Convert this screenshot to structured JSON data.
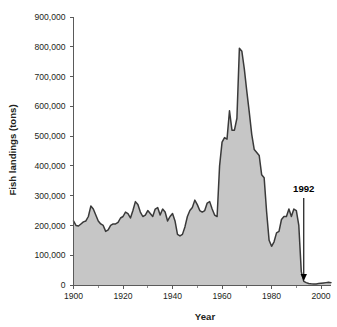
{
  "chart_data": {
    "type": "area",
    "title": "",
    "xlabel": "Year",
    "ylabel": "Fish landings (tons)",
    "xlim": [
      1900,
      2004
    ],
    "ylim": [
      0,
      900000
    ],
    "grid": false,
    "legend": "none",
    "x_ticks": [
      1900,
      1920,
      1940,
      1960,
      1980,
      2000
    ],
    "x_tick_labels": [
      "1900",
      "1920",
      "1940",
      "1960",
      "1980",
      "2000"
    ],
    "x_minor_ticks": [
      1910,
      1930,
      1950,
      1970,
      1990
    ],
    "y_ticks": [
      0,
      100000,
      200000,
      300000,
      400000,
      500000,
      600000,
      700000,
      800000,
      900000
    ],
    "y_tick_labels": [
      "0",
      "100,000",
      "200,000",
      "300,000",
      "400,000",
      "500,000",
      "600,000",
      "700,000",
      "800,000",
      "900,000"
    ],
    "series": [
      {
        "name": "Fish landings",
        "fill_color": "#c6c6c6",
        "line_color": "#3a3a3a",
        "x": [
          1900,
          1901,
          1902,
          1903,
          1904,
          1905,
          1906,
          1907,
          1908,
          1909,
          1910,
          1911,
          1912,
          1913,
          1914,
          1915,
          1916,
          1917,
          1918,
          1919,
          1920,
          1921,
          1922,
          1923,
          1924,
          1925,
          1926,
          1927,
          1928,
          1929,
          1930,
          1931,
          1932,
          1933,
          1934,
          1935,
          1936,
          1937,
          1938,
          1939,
          1940,
          1941,
          1942,
          1943,
          1944,
          1945,
          1946,
          1947,
          1948,
          1949,
          1950,
          1951,
          1952,
          1953,
          1954,
          1955,
          1956,
          1957,
          1958,
          1959,
          1960,
          1961,
          1962,
          1963,
          1964,
          1965,
          1966,
          1967,
          1968,
          1969,
          1970,
          1971,
          1972,
          1973,
          1974,
          1975,
          1976,
          1977,
          1978,
          1979,
          1980,
          1981,
          1982,
          1983,
          1984,
          1985,
          1986,
          1987,
          1988,
          1989,
          1990,
          1991,
          1992,
          1993,
          1994,
          1995,
          1996,
          1997,
          1998,
          1999,
          2000,
          2001,
          2002,
          2003,
          2004
        ],
        "values": [
          215000,
          200000,
          198000,
          205000,
          212000,
          215000,
          230000,
          265000,
          255000,
          235000,
          215000,
          205000,
          200000,
          180000,
          185000,
          200000,
          205000,
          205000,
          210000,
          225000,
          230000,
          245000,
          240000,
          225000,
          250000,
          280000,
          270000,
          245000,
          230000,
          235000,
          250000,
          240000,
          230000,
          255000,
          260000,
          235000,
          255000,
          245000,
          215000,
          230000,
          240000,
          215000,
          170000,
          165000,
          170000,
          195000,
          230000,
          250000,
          260000,
          285000,
          270000,
          250000,
          245000,
          250000,
          275000,
          280000,
          255000,
          235000,
          230000,
          400000,
          480000,
          495000,
          490000,
          585000,
          520000,
          520000,
          560000,
          795000,
          785000,
          725000,
          650000,
          580000,
          505000,
          455000,
          445000,
          435000,
          370000,
          360000,
          245000,
          150000,
          130000,
          145000,
          175000,
          180000,
          220000,
          230000,
          230000,
          255000,
          230000,
          255000,
          250000,
          200000,
          45000,
          12000,
          8000,
          5000,
          4000,
          3500,
          3500,
          5000,
          6000,
          7000,
          8000,
          9000,
          8000
        ]
      }
    ],
    "annotations": [
      {
        "name": "collapse-marker",
        "label": "1992",
        "x": 1993,
        "arrow": "down"
      }
    ]
  }
}
